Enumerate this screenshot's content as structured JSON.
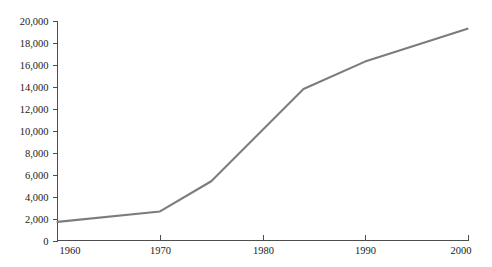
{
  "chart_data": {
    "type": "line",
    "title": "",
    "subtitle": "",
    "xlabel": "",
    "ylabel": "",
    "xlim": [
      1960,
      2000
    ],
    "ylim": [
      0,
      20000
    ],
    "grid": false,
    "legend": null,
    "legend_position": "none",
    "x": [
      1960,
      1970,
      1975,
      1984,
      1990,
      2000
    ],
    "series": [
      {
        "name": "series-1",
        "color": "#7c7c7c",
        "values": [
          1700,
          2650,
          5400,
          13800,
          16300,
          19300
        ]
      }
    ],
    "x_ticks": [
      1960,
      1970,
      1980,
      1990,
      2000
    ],
    "x_tick_labels": [
      "1960",
      "1970",
      "1980",
      "1990",
      "2000"
    ],
    "y_ticks": [
      0,
      2000,
      4000,
      6000,
      8000,
      10000,
      12000,
      14000,
      16000,
      18000,
      20000
    ],
    "y_tick_labels": [
      "0",
      "2,000",
      "4,000",
      "6,000",
      "8,000",
      "10,000",
      "12,000",
      "14,000",
      "16,000",
      "18,000",
      "20,000"
    ],
    "annotations": []
  },
  "style": {
    "axis_color": "#4d4d4d",
    "line_color": "#7c7c7c",
    "background": "#ffffff",
    "text_color": "#1a1a1a"
  }
}
